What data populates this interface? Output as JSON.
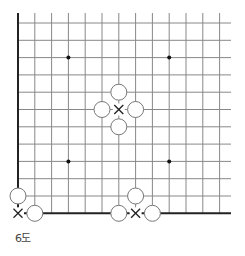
{
  "diagram": {
    "type": "go-board-fragment",
    "caption": "6도",
    "grid": {
      "origin_x": 18,
      "origin_y": 23,
      "dx": 16.8,
      "dy": 17.3,
      "cols": 13,
      "rows": 12,
      "right_extent": 231,
      "top_extent": 13,
      "left_edge_thick": true,
      "bottom_edge_thick": true,
      "line_color": "#888888",
      "edge_color": "#333333"
    },
    "star_points": [
      [
        3,
        2
      ],
      [
        9,
        2
      ],
      [
        3,
        8
      ],
      [
        9,
        8
      ]
    ],
    "white_stones": [
      [
        6,
        4
      ],
      [
        5,
        5
      ],
      [
        7,
        5
      ],
      [
        6,
        6
      ],
      [
        0,
        10
      ],
      [
        1,
        11
      ],
      [
        7,
        10
      ],
      [
        6,
        11
      ],
      [
        8,
        11
      ]
    ],
    "cross_marks": [
      [
        6,
        5
      ],
      [
        0,
        11
      ],
      [
        7,
        11
      ]
    ],
    "stone_radius": 8,
    "colors": {
      "stone_fill": "#ffffff",
      "stone_stroke": "#777777",
      "mark": "#222222",
      "star": "#111111"
    }
  }
}
